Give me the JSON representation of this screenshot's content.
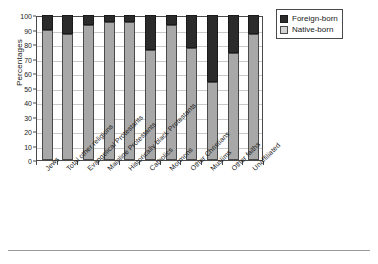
{
  "chart_data": {
    "type": "bar",
    "title": "",
    "xlabel": "",
    "ylabel": "Percentages",
    "ylim": [
      0,
      100
    ],
    "ytick_step": 10,
    "yticks": [
      0,
      10,
      20,
      30,
      40,
      50,
      60,
      70,
      80,
      90,
      100
    ],
    "grid": true,
    "stacked": true,
    "legend_position": "top-right",
    "categories": [
      "Jews",
      "Total other religions",
      "Evangelical Protestants",
      "Mainline Protestants",
      "Historically black Protestants",
      "Catholics",
      "Mormons",
      "Other Christians",
      "Muslims",
      "Other faiths",
      "Unaffiliated"
    ],
    "series": [
      {
        "name": "Native-born",
        "color": "#a8a8a8",
        "values": [
          90,
          87,
          93,
          95,
          95,
          76,
          93,
          77,
          54,
          74,
          87
        ]
      },
      {
        "name": "Foreign-born",
        "color": "#2b2b2b",
        "values": [
          10,
          13,
          7,
          5,
          5,
          24,
          7,
          23,
          46,
          26,
          13
        ]
      }
    ]
  },
  "legend": {
    "items": [
      {
        "label": "Foreign-born",
        "swatch": "dark-swatch"
      },
      {
        "label": "Native-born",
        "swatch": "light-swatch"
      }
    ]
  },
  "colors": {
    "native_born": "#a8a8a8",
    "foreign_born": "#2b2b2b",
    "axis": "#4a4a4a",
    "gridline": "#c9c9c9",
    "background": "#ffffff"
  }
}
